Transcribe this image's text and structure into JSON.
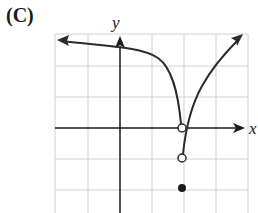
{
  "figure_label": "(C)",
  "axes": {
    "x_label": "x",
    "y_label": "y"
  },
  "grid": {
    "x_lines_px": [
      55,
      88,
      120,
      152,
      184,
      216,
      248
    ],
    "y_lines_px": [
      34,
      66,
      97,
      128,
      159,
      190
    ],
    "color": "#cfcfcf"
  },
  "colors": {
    "curve": "#2b2b2b",
    "axis": "#1a1a1a"
  },
  "features": {
    "left_branch": "approaches horizontal asymptote to the left, drops steeply to open circle at (2, 0)",
    "right_branch": "starts at open circle (2, -1) and rises to the upper right",
    "open_points": [
      [
        2,
        0
      ],
      [
        2,
        -1
      ]
    ],
    "filled_points": [
      [
        2,
        -2
      ]
    ]
  }
}
